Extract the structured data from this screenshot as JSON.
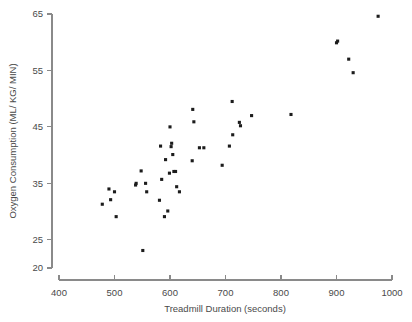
{
  "chart_data": {
    "type": "scatter",
    "title": "",
    "xlabel": "Treadmill Duration (seconds)",
    "ylabel": "Oxygen Consumption (ML/ KG/ MIN)",
    "xlim": [
      400,
      1000
    ],
    "ylim": [
      20,
      65
    ],
    "xticks": [
      400,
      500,
      600,
      700,
      800,
      900,
      1000
    ],
    "xtick_labels": [
      "400",
      "500",
      "600",
      "700",
      "800",
      "900",
      "1000"
    ],
    "yticks": [
      20,
      25,
      35,
      45,
      55,
      65
    ],
    "ytick_labels": [
      "20",
      "25",
      "35",
      "45",
      "55",
      "65"
    ],
    "grid": false,
    "legend": null,
    "series": [
      {
        "name": "observations",
        "marker": "square",
        "color": "#1c1c1c",
        "points": [
          [
            478,
            31.3
          ],
          [
            490,
            34.0
          ],
          [
            493,
            32.1
          ],
          [
            500,
            33.5
          ],
          [
            503,
            29.1
          ],
          [
            538,
            34.7
          ],
          [
            539,
            35.0
          ],
          [
            548,
            37.2
          ],
          [
            551,
            23.1
          ],
          [
            556,
            35.0
          ],
          [
            558,
            33.5
          ],
          [
            581,
            32.0
          ],
          [
            583,
            41.6
          ],
          [
            585,
            35.7
          ],
          [
            590,
            29.1
          ],
          [
            592,
            39.2
          ],
          [
            596,
            30.1
          ],
          [
            599,
            36.8
          ],
          [
            600,
            45.0
          ],
          [
            602,
            41.5
          ],
          [
            603,
            42.1
          ],
          [
            605,
            40.1
          ],
          [
            607,
            37.1
          ],
          [
            610,
            37.1
          ],
          [
            612,
            34.4
          ],
          [
            617,
            33.5
          ],
          [
            640,
            39.0
          ],
          [
            641,
            48.1
          ],
          [
            643,
            45.9
          ],
          [
            653,
            41.3
          ],
          [
            661,
            41.3
          ],
          [
            694,
            38.2
          ],
          [
            707,
            41.6
          ],
          [
            712,
            49.5
          ],
          [
            713,
            43.6
          ],
          [
            725,
            45.8
          ],
          [
            727,
            45.2
          ],
          [
            747,
            47.0
          ],
          [
            818,
            47.2
          ],
          [
            900,
            59.9
          ],
          [
            902,
            60.2
          ],
          [
            922,
            57.0
          ],
          [
            930,
            54.6
          ],
          [
            975,
            64.6
          ]
        ]
      }
    ]
  },
  "axes": {
    "y_title": "Oxygen Consumption (ML/ KG/ MIN)",
    "x_title": "Treadmill Duration (seconds)"
  }
}
